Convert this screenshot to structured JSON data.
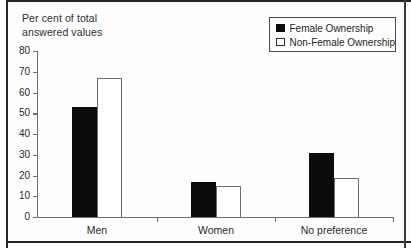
{
  "figure": {
    "caption_line1": "Per cent of total",
    "caption_line2": "answered values"
  },
  "legend": {
    "items": [
      {
        "label": "Female Ownership",
        "swatch": "filled-black-square"
      },
      {
        "label": "Non-Female Ownership",
        "swatch": "outlined-white-square"
      }
    ]
  },
  "chart_data": {
    "type": "bar",
    "categories": [
      "Men",
      "Women",
      "No preference"
    ],
    "series": [
      {
        "name": "Female Ownership",
        "values": [
          53,
          17,
          31
        ],
        "fill": "#0c0c0c"
      },
      {
        "name": "Non-Female Ownership",
        "values": [
          67,
          15,
          19
        ],
        "fill": "#ffffff",
        "border": "#6e6e6e"
      }
    ],
    "title": "",
    "xlabel": "",
    "ylabel": "Per cent of total answered values",
    "ylim": [
      0,
      80
    ],
    "ytick_step": 10,
    "yticks": [
      0,
      10,
      20,
      30,
      40,
      50,
      60,
      70,
      80
    ],
    "grid": false,
    "legend_position": "top-right"
  },
  "colors": {
    "bar_female": "#0c0c0c",
    "bar_nonfemale_fill": "#ffffff",
    "bar_nonfemale_border": "#6e6e6e",
    "axis": "#6e6e6e",
    "text": "#2b2b2b",
    "frame": "#262626",
    "background": "#fefefe"
  }
}
